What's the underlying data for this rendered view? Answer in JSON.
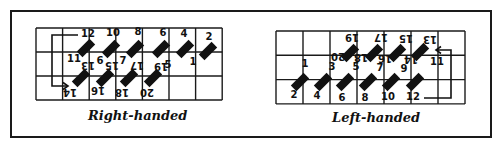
{
  "figure": {
    "panels": [
      {
        "id": "right",
        "caption": "Right-handed",
        "grid": {
          "x": 36,
          "y": 28,
          "cols": 7,
          "rows": 3,
          "cw": 26.6,
          "rh": 24
        },
        "labels": [
          {
            "t": "12",
            "x": 88,
            "y": 37,
            "r": 0
          },
          {
            "t": "10",
            "x": 113,
            "y": 36,
            "r": 0
          },
          {
            "t": "8",
            "x": 138,
            "y": 35,
            "r": 0
          },
          {
            "t": "6",
            "x": 163,
            "y": 36,
            "r": 0
          },
          {
            "t": "4",
            "x": 184,
            "y": 37,
            "r": 0
          },
          {
            "t": "2",
            "x": 209,
            "y": 40,
            "r": 0
          },
          {
            "t": "11",
            "x": 74,
            "y": 62,
            "r": 0
          },
          {
            "t": "9",
            "x": 100,
            "y": 63,
            "r": 180
          },
          {
            "t": "7",
            "x": 123,
            "y": 64,
            "r": 0
          },
          {
            "t": "5",
            "x": 168,
            "y": 68,
            "r": 0
          },
          {
            "t": "1",
            "x": 193,
            "y": 65,
            "r": 0
          },
          {
            "t": "13",
            "x": 88,
            "y": 69,
            "r": 180
          },
          {
            "t": "15",
            "x": 112,
            "y": 69,
            "r": 180
          },
          {
            "t": "17",
            "x": 137,
            "y": 69,
            "r": 180
          },
          {
            "t": "19",
            "x": 161,
            "y": 70,
            "r": 180
          },
          {
            "t": "14",
            "x": 70,
            "y": 96,
            "r": 180
          },
          {
            "t": "16",
            "x": 98,
            "y": 94,
            "r": 180
          },
          {
            "t": "18",
            "x": 122,
            "y": 96,
            "r": 180
          },
          {
            "t": "20",
            "x": 147,
            "y": 96,
            "r": 180
          }
        ],
        "bars": [
          {
            "x": 86,
            "y": 48
          },
          {
            "x": 111,
            "y": 49
          },
          {
            "x": 135,
            "y": 49
          },
          {
            "x": 161,
            "y": 49
          },
          {
            "x": 185,
            "y": 49
          },
          {
            "x": 208,
            "y": 51
          },
          {
            "x": 81,
            "y": 78
          },
          {
            "x": 105,
            "y": 78
          },
          {
            "x": 129,
            "y": 78
          },
          {
            "x": 153,
            "y": 78
          }
        ],
        "bar_angle": -45,
        "arrow": "M78,35 L52,35 L52,86 L68,86"
      },
      {
        "id": "left",
        "caption": "Left-handed",
        "grid": {
          "x": 276,
          "y": 31,
          "cols": 7,
          "rows": 3,
          "cw": 27,
          "rh": 24.3
        },
        "labels": [
          {
            "t": "19",
            "x": 352,
            "y": 41,
            "r": 180
          },
          {
            "t": "17",
            "x": 381,
            "y": 41,
            "r": 180
          },
          {
            "t": "15",
            "x": 406,
            "y": 42,
            "r": 180
          },
          {
            "t": "13",
            "x": 430,
            "y": 43,
            "r": 180
          },
          {
            "t": "20",
            "x": 338,
            "y": 60,
            "r": 180
          },
          {
            "t": "18",
            "x": 361,
            "y": 61,
            "r": 180
          },
          {
            "t": "16",
            "x": 385,
            "y": 62,
            "r": 180
          },
          {
            "t": "14",
            "x": 411,
            "y": 63,
            "r": 180
          },
          {
            "t": "11",
            "x": 437,
            "y": 65,
            "r": 0
          },
          {
            "t": "1",
            "x": 305,
            "y": 67,
            "r": 0
          },
          {
            "t": "3",
            "x": 332,
            "y": 70,
            "r": 0
          },
          {
            "t": "5",
            "x": 356,
            "y": 70,
            "r": 0
          },
          {
            "t": "7",
            "x": 380,
            "y": 71,
            "r": 0
          },
          {
            "t": "9",
            "x": 404,
            "y": 72,
            "r": 0
          },
          {
            "t": "2",
            "x": 294,
            "y": 98,
            "r": 0
          },
          {
            "t": "4",
            "x": 317,
            "y": 99,
            "r": 0
          },
          {
            "t": "6",
            "x": 342,
            "y": 101,
            "r": 0
          },
          {
            "t": "8",
            "x": 365,
            "y": 101,
            "r": 0
          },
          {
            "t": "10",
            "x": 388,
            "y": 100,
            "r": 0
          },
          {
            "t": "12",
            "x": 413,
            "y": 100,
            "r": 0
          }
        ],
        "bars": [
          {
            "x": 350,
            "y": 53
          },
          {
            "x": 374,
            "y": 53
          },
          {
            "x": 397,
            "y": 53
          },
          {
            "x": 420,
            "y": 52
          },
          {
            "x": 300,
            "y": 82
          },
          {
            "x": 323,
            "y": 82
          },
          {
            "x": 345,
            "y": 82
          },
          {
            "x": 368,
            "y": 82
          },
          {
            "x": 391,
            "y": 82
          },
          {
            "x": 415,
            "y": 82
          }
        ],
        "bar_angle": -45,
        "arrow": "M424,98 L451,98 L451,50 L436,50"
      }
    ]
  }
}
